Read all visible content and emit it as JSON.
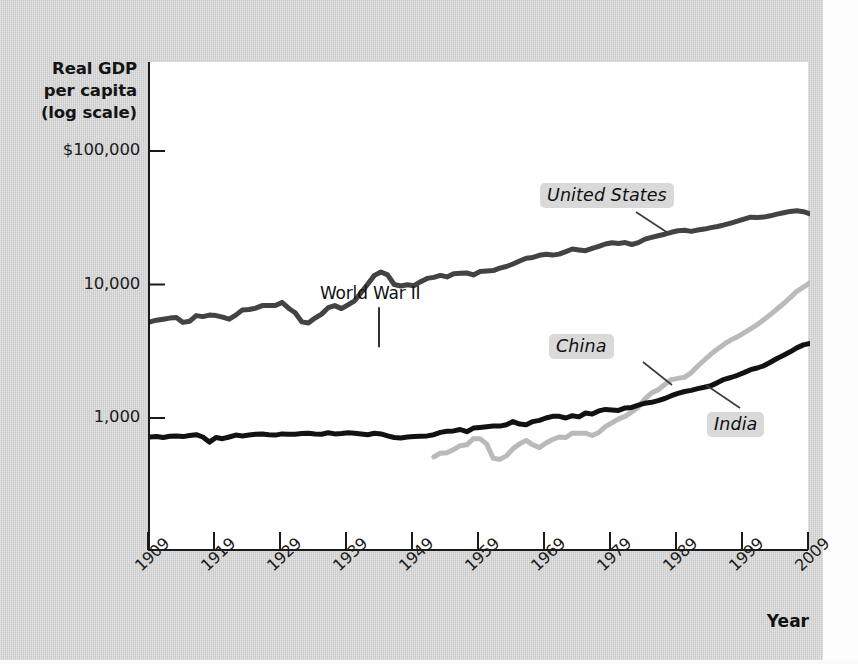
{
  "chart_data": {
    "type": "line",
    "title": "",
    "ylabel": "Real GDP per capita (log scale)",
    "xlabel": "Year",
    "y_scale": "log",
    "ylim": [
      105,
      220000
    ],
    "xlim": [
      1909,
      2009
    ],
    "grid": false,
    "legend_position": "inline-labels",
    "ytick_labels": [
      "$100,000",
      "10,000",
      "1,000"
    ],
    "ytick_values": [
      100000,
      10000,
      1000
    ],
    "xtick_labels": [
      "1909",
      "1919",
      "1929",
      "1939",
      "1949",
      "1959",
      "1969",
      "1979",
      "1989",
      "1999",
      "2009"
    ],
    "xtick_values": [
      1909,
      1919,
      1929,
      1939,
      1949,
      1959,
      1969,
      1979,
      1989,
      1999,
      2009
    ],
    "annotations": [
      {
        "text": "World War II",
        "x": 1944,
        "y": 13000
      }
    ],
    "series": [
      {
        "name": "United States",
        "color": "#434343",
        "width": 5,
        "label_position": {
          "x": 1983,
          "y": 42000
        },
        "x": [
          1909,
          1910,
          1911,
          1912,
          1913,
          1914,
          1915,
          1916,
          1917,
          1918,
          1919,
          1920,
          1921,
          1922,
          1923,
          1924,
          1925,
          1926,
          1927,
          1928,
          1929,
          1930,
          1931,
          1932,
          1933,
          1934,
          1935,
          1936,
          1937,
          1938,
          1939,
          1940,
          1941,
          1942,
          1943,
          1944,
          1945,
          1946,
          1947,
          1948,
          1949,
          1950,
          1951,
          1952,
          1953,
          1954,
          1955,
          1956,
          1957,
          1958,
          1959,
          1960,
          1961,
          1962,
          1963,
          1964,
          1965,
          1966,
          1967,
          1968,
          1969,
          1970,
          1971,
          1972,
          1973,
          1974,
          1975,
          1976,
          1977,
          1978,
          1979,
          1980,
          1981,
          1982,
          1983,
          1984,
          1985,
          1986,
          1987,
          1988,
          1989,
          1990,
          1991,
          1992,
          1993,
          1994,
          1995,
          1996,
          1997,
          1998,
          1999,
          2000,
          2001,
          2002,
          2003,
          2004,
          2005,
          2006,
          2007,
          2008,
          2009
        ],
        "y": [
          5250,
          5400,
          5500,
          5600,
          5650,
          5200,
          5300,
          5850,
          5750,
          5900,
          5850,
          5700,
          5500,
          5900,
          6450,
          6500,
          6650,
          6950,
          6950,
          6950,
          7350,
          6650,
          6150,
          5250,
          5150,
          5600,
          6000,
          6700,
          6950,
          6600,
          7050,
          7550,
          8700,
          10100,
          11700,
          12400,
          11800,
          10000,
          9750,
          9950,
          9800,
          10500,
          11100,
          11300,
          11700,
          11400,
          12050,
          12150,
          12200,
          11800,
          12500,
          12600,
          12700,
          13250,
          13650,
          14250,
          15000,
          15750,
          15950,
          16550,
          16850,
          16600,
          16900,
          17650,
          18450,
          18150,
          17900,
          18650,
          19300,
          20100,
          20550,
          20300,
          20600,
          19950,
          20600,
          21900,
          22550,
          23150,
          23800,
          24600,
          25250,
          25450,
          25000,
          25600,
          26000,
          26700,
          27200,
          27950,
          28850,
          29800,
          30900,
          31900,
          31800,
          32000,
          32700,
          33650,
          34500,
          35300,
          35700,
          35100,
          33850
        ]
      },
      {
        "name": "China",
        "color": "#bababa",
        "width": 5,
        "label_position": {
          "x": 1962,
          "y": 2750
        },
        "x": [
          1952,
          1953,
          1954,
          1955,
          1956,
          1957,
          1958,
          1959,
          1960,
          1961,
          1962,
          1963,
          1964,
          1965,
          1966,
          1967,
          1968,
          1969,
          1970,
          1971,
          1972,
          1973,
          1974,
          1975,
          1976,
          1977,
          1978,
          1979,
          1980,
          1981,
          1982,
          1983,
          1984,
          1985,
          1986,
          1987,
          1988,
          1989,
          1990,
          1991,
          1992,
          1993,
          1994,
          1995,
          1996,
          1997,
          1998,
          1999,
          2000,
          2001,
          2002,
          2003,
          2004,
          2005,
          2006,
          2007,
          2008,
          2009
        ],
        "y": [
          510,
          545,
          550,
          580,
          620,
          630,
          700,
          700,
          640,
          500,
          490,
          520,
          590,
          640,
          680,
          630,
          600,
          650,
          690,
          720,
          715,
          770,
          770,
          770,
          740,
          780,
          860,
          920,
          985,
          1030,
          1110,
          1210,
          1390,
          1540,
          1630,
          1780,
          1940,
          1980,
          2020,
          2180,
          2450,
          2720,
          3010,
          3290,
          3570,
          3840,
          4060,
          4340,
          4660,
          5010,
          5450,
          5950,
          6550,
          7180,
          7960,
          8900,
          9550,
          10300
        ]
      },
      {
        "name": "India",
        "color": "#121212",
        "width": 5,
        "label_position": {
          "x": 1992,
          "y": 1130
        },
        "x": [
          1909,
          1910,
          1911,
          1912,
          1913,
          1914,
          1915,
          1916,
          1917,
          1918,
          1919,
          1920,
          1921,
          1922,
          1923,
          1924,
          1925,
          1926,
          1927,
          1928,
          1929,
          1930,
          1931,
          1932,
          1933,
          1934,
          1935,
          1936,
          1937,
          1938,
          1939,
          1940,
          1941,
          1942,
          1943,
          1944,
          1945,
          1946,
          1947,
          1948,
          1949,
          1950,
          1951,
          1952,
          1953,
          1954,
          1955,
          1956,
          1957,
          1958,
          1959,
          1960,
          1961,
          1962,
          1963,
          1964,
          1965,
          1966,
          1967,
          1968,
          1969,
          1970,
          1971,
          1972,
          1973,
          1974,
          1975,
          1976,
          1977,
          1978,
          1979,
          1980,
          1981,
          1982,
          1983,
          1984,
          1985,
          1986,
          1987,
          1988,
          1989,
          1990,
          1991,
          1992,
          1993,
          1994,
          1995,
          1996,
          1997,
          1998,
          1999,
          2000,
          2001,
          2002,
          2003,
          2004,
          2005,
          2006,
          2007,
          2008,
          2009
        ],
        "y": [
          720,
          725,
          715,
          730,
          735,
          725,
          740,
          750,
          720,
          660,
          715,
          700,
          720,
          745,
          735,
          745,
          755,
          760,
          750,
          745,
          760,
          755,
          755,
          765,
          770,
          760,
          755,
          775,
          760,
          765,
          775,
          770,
          760,
          750,
          770,
          760,
          735,
          715,
          710,
          720,
          725,
          730,
          735,
          750,
          780,
          795,
          800,
          820,
          790,
          840,
          850,
          860,
          870,
          870,
          890,
          940,
          900,
          890,
          940,
          960,
          1000,
          1030,
          1030,
          1000,
          1040,
          1020,
          1090,
          1070,
          1130,
          1160,
          1150,
          1140,
          1190,
          1200,
          1250,
          1290,
          1310,
          1350,
          1400,
          1470,
          1530,
          1580,
          1610,
          1660,
          1700,
          1750,
          1840,
          1950,
          2010,
          2090,
          2190,
          2300,
          2370,
          2460,
          2620,
          2790,
          2950,
          3130,
          3350,
          3530,
          3620
        ]
      }
    ]
  }
}
